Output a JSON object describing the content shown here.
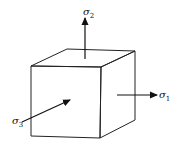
{
  "diagram": {
    "stroke_color": "#222222",
    "labels": {
      "sigma1": {
        "symbol": "σ",
        "subscript": "1"
      },
      "sigma2": {
        "symbol": "σ",
        "subscript": "2"
      },
      "sigma3": {
        "symbol": "σ",
        "subscript": "3"
      }
    },
    "icons": {
      "arrow": "arrow-icon"
    }
  }
}
